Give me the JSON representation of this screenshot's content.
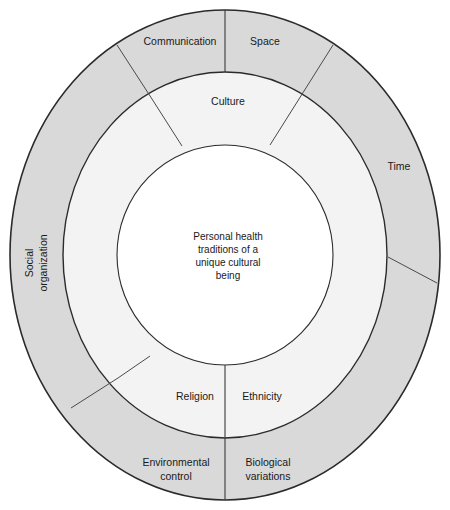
{
  "figure": {
    "type": "concentric-wheel-diagram",
    "background_color": "#ffffff",
    "outline_color": "#2b2b2b"
  },
  "center": {
    "name": "core",
    "fill_color": "#ffffff",
    "lines": [
      "Personal health",
      "traditions of a",
      "unique cultural",
      "being"
    ]
  },
  "middle_ring": {
    "fill_color": "#f3f3f3",
    "segments": [
      {
        "label": "Culture",
        "position": "top"
      },
      {
        "label": "Religion",
        "position": "bottom-left"
      },
      {
        "label": "Ethnicity",
        "position": "bottom-right"
      }
    ]
  },
  "outer_ring": {
    "fill_color": "#d9d9d9",
    "segments": [
      {
        "label": "Communication",
        "position": "top-left"
      },
      {
        "label": "Space",
        "position": "top-right"
      },
      {
        "label": "Time",
        "position": "right"
      },
      {
        "label": "Biological variations",
        "position": "bottom-right",
        "line1": "Biological",
        "line2": "variations"
      },
      {
        "label": "Environmental control",
        "position": "bottom-left",
        "line1": "Environmental",
        "line2": "control"
      },
      {
        "label": "Social organization",
        "position": "left",
        "line1": "Social",
        "line2": "organization",
        "rotated": "-90"
      }
    ]
  }
}
